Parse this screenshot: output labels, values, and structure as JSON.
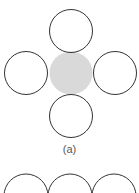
{
  "diagram": {
    "panel_a": {
      "label": "(a)",
      "center_circle": {
        "cx": 71,
        "cy": 73,
        "r": 21.5,
        "fill": "#d9d9d9"
      },
      "outer_circles": [
        {
          "name": "top",
          "cx": 71,
          "cy": 31,
          "r": 21.5
        },
        {
          "name": "left",
          "cx": 26,
          "cy": 73,
          "r": 21.5
        },
        {
          "name": "right",
          "cx": 115,
          "cy": 73,
          "r": 21.5
        },
        {
          "name": "bottom",
          "cx": 71,
          "cy": 116,
          "r": 21.5
        }
      ]
    },
    "panel_b": {
      "circles": [
        {
          "cx": 26,
          "cy": 196,
          "r": 22
        },
        {
          "cx": 70,
          "cy": 196,
          "r": 22
        },
        {
          "cx": 114,
          "cy": 196,
          "r": 22
        }
      ]
    },
    "stroke_color": "#333333"
  }
}
